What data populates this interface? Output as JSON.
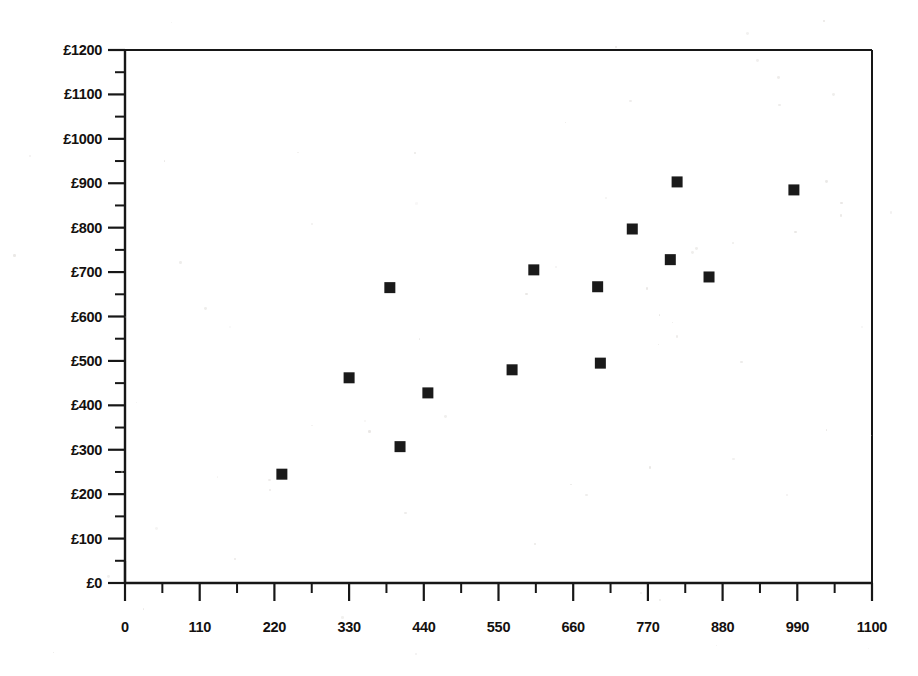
{
  "chart_data": {
    "type": "scatter",
    "title": "",
    "subtitle": "",
    "xlabel": "",
    "ylabel": "",
    "xlim": [
      0,
      1100
    ],
    "ylim": [
      0,
      1200
    ],
    "x_major_step": 110,
    "x_minor_step": 55,
    "y_major_step": 100,
    "y_minor_step": 50,
    "grid": false,
    "legend": null,
    "legend_position": "none",
    "y_tick_prefix": "£",
    "marker": {
      "shape": "square",
      "color": "#1a1a1a",
      "size_px": 11
    },
    "x_tick_labels": [
      "0",
      "110",
      "220",
      "330",
      "440",
      "550",
      "660",
      "770",
      "880",
      "990",
      "1100"
    ],
    "x_tick_values": [
      0,
      110,
      220,
      330,
      440,
      550,
      660,
      770,
      880,
      990,
      1100
    ],
    "y_tick_labels": [
      "£0",
      "£100",
      "£200",
      "£300",
      "£400",
      "£500",
      "£600",
      "£700",
      "£800",
      "£900",
      "£1000",
      "£1100",
      "£1200"
    ],
    "y_tick_values": [
      0,
      100,
      200,
      300,
      400,
      500,
      600,
      700,
      800,
      900,
      1000,
      1100,
      1200
    ],
    "points": [
      {
        "x": 231,
        "y": 245
      },
      {
        "x": 330,
        "y": 462
      },
      {
        "x": 390,
        "y": 665
      },
      {
        "x": 405,
        "y": 307
      },
      {
        "x": 446,
        "y": 428
      },
      {
        "x": 570,
        "y": 480
      },
      {
        "x": 602,
        "y": 705
      },
      {
        "x": 696,
        "y": 667
      },
      {
        "x": 700,
        "y": 495
      },
      {
        "x": 747,
        "y": 797
      },
      {
        "x": 803,
        "y": 728
      },
      {
        "x": 813,
        "y": 903
      },
      {
        "x": 860,
        "y": 689
      },
      {
        "x": 985,
        "y": 885
      }
    ]
  },
  "colors": {
    "axis": "#171717",
    "marker": "#1a1a1a",
    "background": "#ffffff",
    "text": "#14110f"
  }
}
